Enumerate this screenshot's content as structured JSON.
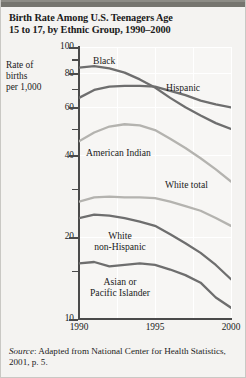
{
  "figure": {
    "title_line1": "Birth Rate Among U.S. Teenagers Age",
    "title_line2": "15 to 17, by Ethnic Group, 1990–2000",
    "source_prefix": "Source",
    "source_text": ": Adapted from National Center for Health Statistics, 2001, p. 5.",
    "colors": {
      "background": "#f4f3f1",
      "plot_background": "#f7f6f4",
      "axis": "#4a4a4a",
      "gridline": "#ffffff",
      "topbar": "#76756f",
      "dark_series": "#6e6e6e",
      "light_series": "#b4b3af",
      "text": "#1b1b1b"
    }
  },
  "axis_label": {
    "line1": "Rate of",
    "line2": "births",
    "line3": "per 1,000"
  },
  "chart_data": {
    "type": "line",
    "title": "Birth Rate Among U.S. Teenagers Age 15 to 17, by Ethnic Group, 1990–2000",
    "xlabel": "",
    "ylabel": "Rate of births per 1,000",
    "yscale": "log",
    "ylim": [
      10,
      100
    ],
    "xlim": [
      1990,
      2000
    ],
    "grid": true,
    "legend_position": "inline-labels",
    "ytick_labels": [
      "100",
      "80",
      "60",
      "40",
      "20",
      "10"
    ],
    "ytick_values": [
      100,
      80,
      60,
      40,
      20,
      10
    ],
    "yminor_values": [
      90,
      70,
      50,
      30,
      15
    ],
    "xtick_labels": [
      "1990",
      "1995",
      "2000"
    ],
    "xtick_values": [
      1990,
      1995,
      2000
    ],
    "x": [
      1990,
      1991,
      1992,
      1993,
      1994,
      1995,
      1996,
      1997,
      1998,
      1999,
      2000
    ],
    "series": [
      {
        "name": "Black",
        "label": "Black",
        "color": "#6e6e6e",
        "values": [
          84.0,
          85.0,
          83.5,
          80.5,
          76.0,
          71.0,
          65.0,
          60.0,
          56.0,
          52.5,
          50.0
        ]
      },
      {
        "name": "Hispanic",
        "label": "Hispanic",
        "color": "#6e6e6e",
        "values": [
          65.0,
          69.5,
          71.5,
          72.0,
          72.0,
          71.5,
          69.0,
          66.5,
          63.5,
          61.5,
          60.0
        ]
      },
      {
        "name": "American Indian",
        "label": "American Indian",
        "color": "#b4b3af",
        "values": [
          45.0,
          48.5,
          51.0,
          52.0,
          51.5,
          49.5,
          46.0,
          42.5,
          39.0,
          35.5,
          32.0
        ]
      },
      {
        "name": "White total",
        "label": "White total",
        "color": "#b4b3af",
        "values": [
          27.0,
          28.0,
          28.2,
          28.0,
          28.0,
          27.8,
          27.0,
          26.0,
          25.0,
          23.5,
          22.0
        ]
      },
      {
        "name": "White non-Hispanic",
        "label": "White non-Hispanic",
        "color": "#6e6e6e",
        "label_line1": "White",
        "label_line2": "non-Hispanic",
        "values": [
          23.5,
          24.2,
          24.0,
          23.5,
          22.8,
          22.0,
          20.5,
          19.0,
          17.5,
          15.8,
          14.0
        ]
      },
      {
        "name": "Asian or Pacific Islander",
        "label": "Asian or Pacific Islander",
        "color": "#6e6e6e",
        "label_line1": "Asian or",
        "label_line2": "Pacific Islander",
        "values": [
          16.0,
          16.2,
          15.6,
          15.8,
          16.0,
          15.8,
          15.2,
          14.5,
          13.6,
          12.0,
          11.0
        ]
      }
    ]
  }
}
